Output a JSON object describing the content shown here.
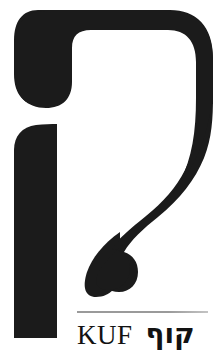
{
  "page": {
    "background_color": "#ffffff",
    "width": 213,
    "height": 354
  },
  "glyph": {
    "name": "hebrew-letter-kuf",
    "character": "ק",
    "ink_color": "#1b1b1b",
    "description": "Large black display rendering of the Hebrew letter Kuf",
    "strokes": [
      {
        "name": "top-horizontal-bar",
        "description": "Thick horizontal bar across the top with a rounded bulb terminal at the left and a rounded corner at the upper right"
      },
      {
        "name": "right-descending-leg",
        "description": "Curved leg descending from the right end of the top bar, sweeping down and to the left, ending in a rounded teardrop bulb"
      },
      {
        "name": "left-descender-stroke",
        "description": "Separate vertical stroke at the left, rounded at the top left, running straight down past the baseline"
      }
    ]
  },
  "caption": {
    "rule_color": "#9a9a9a",
    "latin_name": "KUF",
    "hebrew_name": "קוף",
    "text_color": "#121212"
  }
}
